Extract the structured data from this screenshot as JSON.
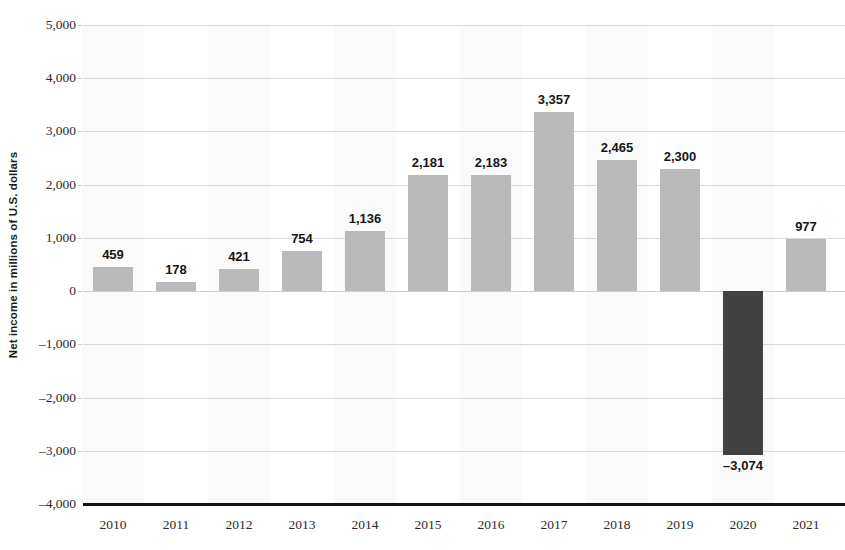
{
  "chart_data": {
    "type": "bar",
    "title": "",
    "subtitle": "",
    "xlabel": "",
    "ylabel": "Net income in millions of U.S. dollars",
    "ylim": [
      -4000,
      5000
    ],
    "ytick_values": [
      5000,
      4000,
      3000,
      2000,
      1000,
      0,
      -1000,
      -2000,
      -3000,
      -4000
    ],
    "ytick_labels": [
      "5,000",
      "4,000",
      "3,000",
      "2,000",
      "1,000",
      "0",
      "–1,000",
      "–2,000",
      "–3,000",
      "–4,000"
    ],
    "grid": true,
    "grid_axis": "y",
    "legend": false,
    "legend_position": "none",
    "categories": [
      "2010",
      "2011",
      "2012",
      "2013",
      "2014",
      "2015",
      "2016",
      "2017",
      "2018",
      "2019",
      "2020",
      "2021"
    ],
    "values": [
      459,
      178,
      421,
      754,
      1136,
      2181,
      2183,
      3357,
      2465,
      2300,
      -3074,
      977
    ],
    "data_labels": [
      "459",
      "178",
      "421",
      "754",
      "1,136",
      "2,181",
      "2,183",
      "3,357",
      "2,465",
      "2,300",
      "–3,074",
      "977"
    ],
    "bar_colors": [
      "#b9b9b9",
      "#b9b9b9",
      "#b9b9b9",
      "#b9b9b9",
      "#b9b9b9",
      "#b9b9b9",
      "#b9b9b9",
      "#b9b9b9",
      "#b9b9b9",
      "#b9b9b9",
      "#414141",
      "#b9b9b9"
    ],
    "colors": {
      "bar_positive": "#b9b9b9",
      "bar_negative": "#414141",
      "gridline": "#d9d9d9",
      "axis_baseline": "#111111",
      "band": "#fafafa",
      "text": "#2b2b2b",
      "label_text": "#161616",
      "background": "#ffffff"
    }
  }
}
